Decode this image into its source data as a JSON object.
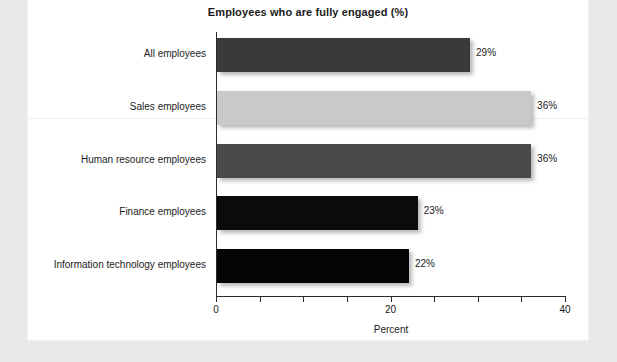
{
  "chart_data": {
    "type": "bar",
    "orientation": "horizontal",
    "title": "Employees who are fully engaged (%)",
    "xlabel": "Percent",
    "ylabel": "",
    "xlim": [
      0,
      40
    ],
    "xticks": [
      0,
      5,
      10,
      15,
      20,
      25,
      30,
      35,
      40
    ],
    "xtick_labels": [
      "0",
      "",
      "",
      "",
      "20",
      "",
      "",
      "",
      "40"
    ],
    "grid": false,
    "legend": "none",
    "categories": [
      "All employees",
      "Sales employees",
      "Human resource employees",
      "Finance employees",
      "Information technology employees"
    ],
    "values": [
      29,
      36,
      36,
      23,
      22
    ],
    "value_labels": [
      "29%",
      "36%",
      "36%",
      "23%",
      "22%"
    ],
    "bar_colors": [
      "#3a3a3a",
      "#c9c9c9",
      "#4a4a4a",
      "#0b0b0b",
      "#050505"
    ]
  },
  "page": {
    "background": "#e9e9e9",
    "card_background": "#ffffff",
    "text_color": "#1b1b1b",
    "axis_color": "#2b2b2b"
  }
}
